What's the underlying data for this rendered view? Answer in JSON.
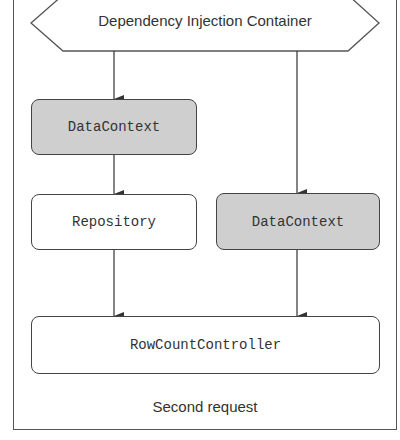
{
  "diagram": {
    "container_label": "Dependency Injection Container",
    "nodes": {
      "datacontext_top": "DataContext",
      "repository": "Repository",
      "datacontext_right": "DataContext",
      "controller": "RowCountController"
    },
    "caption": "Second request",
    "colors": {
      "shaded_fill": "#cfcfcf",
      "plain_fill": "#ffffff",
      "stroke": "#444444"
    }
  }
}
